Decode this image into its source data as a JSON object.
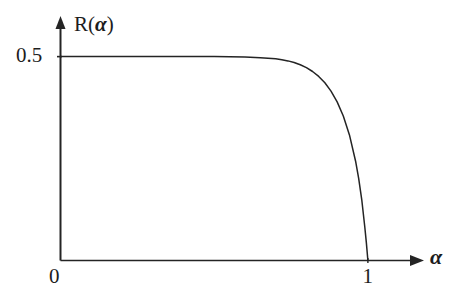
{
  "figure": {
    "background_color": "#ffffff",
    "line_color": "#242424",
    "text_color": "#1d1d1d"
  },
  "axes": {
    "y_axis_title": "R(",
    "y_axis_title_variable": "α",
    "y_axis_title_close": ")",
    "x_axis_title": "α",
    "x_ticks": [
      "0",
      "1"
    ],
    "y_ticks": [
      "0.5"
    ],
    "x_origin_label": "0",
    "x_end_label": "1",
    "y_plateau_label": "0.5",
    "arrow_x": "right",
    "arrow_y": "up"
  },
  "chart_data": {
    "type": "line",
    "title": "",
    "xlabel": "α",
    "ylabel": "R(α)",
    "xlim": [
      0,
      1.15
    ],
    "ylim": [
      0,
      0.58
    ],
    "xticks": [
      0,
      1
    ],
    "xticklabels": [
      "0",
      "1"
    ],
    "yticks": [
      0.5
    ],
    "yticklabels": [
      "0.5"
    ],
    "grid": false,
    "legend": false,
    "series": [
      {
        "name": "R(α)",
        "color": "#242424",
        "linewidth": 1.5,
        "x": [
          0.0,
          0.05,
          0.1,
          0.15,
          0.2,
          0.25,
          0.3,
          0.35,
          0.4,
          0.45,
          0.5,
          0.55,
          0.6,
          0.65,
          0.7,
          0.72,
          0.74,
          0.76,
          0.78,
          0.8,
          0.82,
          0.84,
          0.86,
          0.88,
          0.9,
          0.92,
          0.94,
          0.96,
          0.97,
          0.98,
          0.99,
          0.995,
          1.0
        ],
        "y": [
          0.5,
          0.5,
          0.5,
          0.5,
          0.5,
          0.5,
          0.5,
          0.5,
          0.5,
          0.5,
          0.5,
          0.4995,
          0.499,
          0.4975,
          0.4945,
          0.4925,
          0.4895,
          0.4855,
          0.48,
          0.473,
          0.4635,
          0.4515,
          0.436,
          0.4155,
          0.389,
          0.3545,
          0.308,
          0.2435,
          0.2015,
          0.1495,
          0.0815,
          0.044,
          0.0
        ]
      }
    ],
    "annotations": [
      {
        "text": "plateau at R = 0.5 for small α",
        "visible": false
      },
      {
        "text": "curve meets axis vertically at α = 1",
        "visible": false
      }
    ]
  }
}
